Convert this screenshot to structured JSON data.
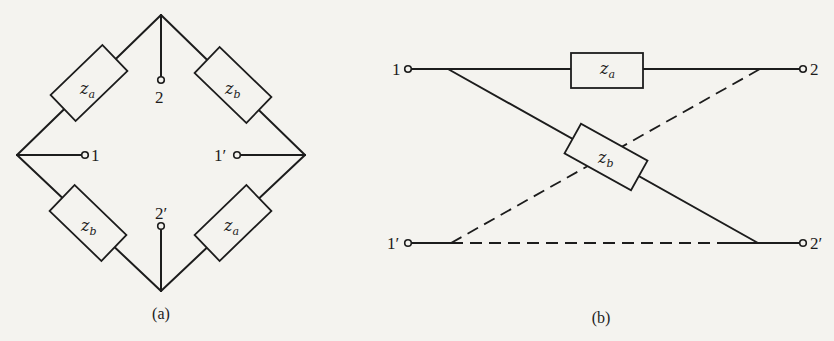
{
  "figure_a": {
    "caption": "(a)",
    "impedances": [
      {
        "position": "top-left",
        "label": "z",
        "sub": "a"
      },
      {
        "position": "top-right",
        "label": "z",
        "sub": "b"
      },
      {
        "position": "bottom-left",
        "label": "z",
        "sub": "b"
      },
      {
        "position": "bottom-right",
        "label": "z",
        "sub": "a"
      }
    ],
    "terminals": {
      "t1": "1",
      "t1p": "1′",
      "t2": "2",
      "t2p": "2′"
    }
  },
  "figure_b": {
    "caption": "(b)",
    "impedances": [
      {
        "position": "series-top",
        "label": "z",
        "sub": "a"
      },
      {
        "position": "cross",
        "label": "z",
        "sub": "b"
      }
    ],
    "terminals": {
      "t1": "1",
      "t1p": "1′",
      "t2": "2",
      "t2p": "2′"
    }
  },
  "colors": {
    "ink": "#1c1c1c",
    "paper": "#f4f3ef"
  }
}
